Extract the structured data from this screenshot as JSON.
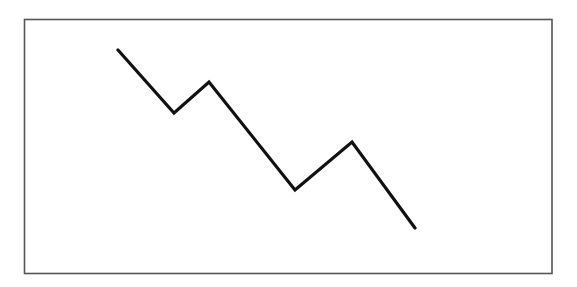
{
  "diagram": {
    "frame": {
      "x": 24.5,
      "y": 19.5,
      "width": 527.5,
      "height": 254,
      "stroke_color": "#555555",
      "fill_color": "#ffffff"
    },
    "line": {
      "color": "#111111",
      "points": [
        [
          118,
          50
        ],
        [
          174,
          113
        ],
        [
          209,
          82
        ],
        [
          295,
          190
        ],
        [
          352,
          142
        ],
        [
          415,
          228
        ]
      ]
    }
  },
  "chart_data": {
    "type": "line",
    "title": "",
    "xlabel": "",
    "ylabel": "",
    "x": [
      0,
      1,
      2,
      3,
      4,
      5
    ],
    "values": [
      178,
      115,
      146,
      38,
      86,
      0
    ],
    "grid": false,
    "legend": null,
    "note": "Unlabeled schematic downward zigzag; values are relative heights above the lowest point (pixel units)."
  }
}
